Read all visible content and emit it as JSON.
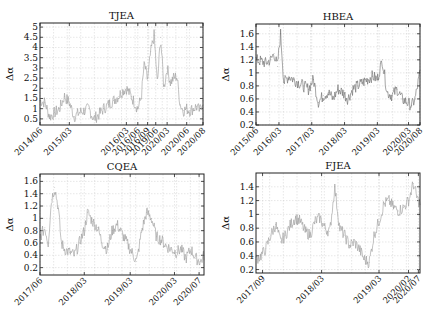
{
  "chart_data": [
    {
      "type": "line",
      "title": "TJEA",
      "xlabel": "",
      "ylabel": "Δα",
      "ylim": [
        0.2,
        5.2
      ],
      "yticks": [
        0.5,
        1,
        1.5,
        2,
        2.5,
        3,
        3.5,
        4,
        4.5,
        5
      ],
      "ytick_labels": [
        "0.5",
        "1",
        "1.5",
        "2",
        "2.5",
        "3",
        "3.5",
        "4",
        "4.5",
        "5"
      ],
      "xtick_labels": [
        "2014/06",
        "2015/03",
        "2016/03",
        "2016/06",
        "2016/09",
        "2019/06",
        "2020/03",
        "2020/06",
        "2020/08"
      ],
      "xtick_positions": [
        0,
        0.18,
        0.53,
        0.6,
        0.66,
        0.71,
        0.78,
        0.9,
        1.0
      ],
      "grid": true,
      "legend": "none",
      "series": [
        {
          "name": "TJEA",
          "color": "#9a9a9a",
          "x": [
            0,
            0.03,
            0.06,
            0.09,
            0.12,
            0.15,
            0.18,
            0.21,
            0.24,
            0.27,
            0.3,
            0.33,
            0.36,
            0.39,
            0.42,
            0.45,
            0.48,
            0.51,
            0.53,
            0.56,
            0.6,
            0.62,
            0.64,
            0.66,
            0.68,
            0.7,
            0.72,
            0.74,
            0.76,
            0.78,
            0.8,
            0.82,
            0.84,
            0.86,
            0.88,
            0.9,
            0.92,
            0.94,
            0.96,
            0.98,
            1.0
          ],
          "values": [
            1.4,
            1.3,
            0.6,
            0.8,
            1.0,
            1.6,
            1.3,
            0.6,
            0.8,
            0.9,
            1.0,
            0.5,
            0.7,
            1.0,
            1.2,
            1.4,
            1.6,
            1.9,
            2.0,
            1.6,
            1.0,
            1.5,
            3.2,
            2.4,
            3.8,
            4.6,
            2.2,
            4.5,
            2.0,
            3.0,
            2.3,
            2.5,
            2.6,
            1.2,
            0.9,
            1.0,
            0.9,
            1.0,
            1.1,
            0.9,
            1.4
          ]
        }
      ]
    },
    {
      "type": "line",
      "title": "HBEA",
      "xlabel": "",
      "ylabel": "Δα",
      "ylim": [
        0.2,
        1.75
      ],
      "yticks": [
        0.2,
        0.4,
        0.6,
        0.8,
        1,
        1.2,
        1.4,
        1.6
      ],
      "ytick_labels": [
        "0.2",
        "0.4",
        "0.6",
        "0.8",
        "1",
        "1.2",
        "1.4",
        "1.6"
      ],
      "xtick_labels": [
        "2015/06",
        "2016/03",
        "2017/03",
        "2018/03",
        "2019/03",
        "2020/03",
        "2020/08"
      ],
      "xtick_positions": [
        0,
        0.14,
        0.34,
        0.54,
        0.74,
        0.93,
        1.0
      ],
      "grid": true,
      "legend": "none",
      "series": [
        {
          "name": "HBEA",
          "color": "#6a6a6a",
          "x": [
            0,
            0.03,
            0.06,
            0.09,
            0.11,
            0.13,
            0.15,
            0.17,
            0.2,
            0.23,
            0.26,
            0.29,
            0.32,
            0.35,
            0.38,
            0.41,
            0.44,
            0.47,
            0.5,
            0.53,
            0.56,
            0.59,
            0.62,
            0.65,
            0.68,
            0.71,
            0.74,
            0.77,
            0.8,
            0.83,
            0.86,
            0.89,
            0.92,
            0.95,
            0.97,
            1.0
          ],
          "values": [
            1.2,
            1.18,
            1.15,
            1.2,
            1.3,
            1.1,
            1.6,
            0.85,
            0.95,
            0.9,
            0.85,
            0.8,
            0.75,
            0.9,
            0.55,
            0.65,
            0.7,
            0.6,
            0.75,
            0.7,
            0.6,
            0.75,
            0.8,
            0.85,
            0.9,
            0.95,
            0.9,
            1.2,
            0.7,
            0.65,
            0.75,
            0.6,
            0.55,
            0.5,
            0.6,
            1.0
          ]
        }
      ]
    },
    {
      "type": "line",
      "title": "CQEA",
      "xlabel": "",
      "ylabel": "Δα",
      "ylim": [
        0.08,
        1.72
      ],
      "yticks": [
        0.2,
        0.4,
        0.6,
        0.8,
        1,
        1.2,
        1.4,
        1.6
      ],
      "ytick_labels": [
        "0.2",
        "0.4",
        "0.6",
        "0.8",
        "1",
        "1.2",
        "1.4",
        "1.6"
      ],
      "xtick_labels": [
        "2017/06",
        "2018/03",
        "2019/03",
        "2020/03",
        "2020/07"
      ],
      "xtick_positions": [
        0,
        0.27,
        0.55,
        0.82,
        0.97
      ],
      "grid": true,
      "legend": "none",
      "series": [
        {
          "name": "CQEA",
          "color": "#9a9a9a",
          "x": [
            0,
            0.03,
            0.05,
            0.07,
            0.09,
            0.11,
            0.13,
            0.15,
            0.18,
            0.21,
            0.24,
            0.27,
            0.29,
            0.32,
            0.35,
            0.38,
            0.41,
            0.44,
            0.47,
            0.5,
            0.53,
            0.56,
            0.59,
            0.62,
            0.65,
            0.68,
            0.71,
            0.74,
            0.77,
            0.8,
            0.83,
            0.86,
            0.89,
            0.92,
            0.95,
            0.98,
            1.0
          ],
          "values": [
            0.7,
            0.85,
            0.6,
            1.3,
            1.5,
            1.2,
            0.6,
            0.5,
            0.45,
            0.4,
            0.6,
            0.8,
            1.1,
            0.95,
            0.85,
            0.6,
            0.5,
            0.8,
            0.9,
            0.75,
            0.6,
            0.45,
            0.3,
            0.8,
            1.1,
            1.0,
            0.7,
            0.65,
            0.55,
            0.5,
            0.45,
            0.5,
            0.35,
            0.5,
            0.35,
            0.3,
            0.4
          ]
        }
      ]
    },
    {
      "type": "line",
      "title": "FJEA",
      "xlabel": "",
      "ylabel": "Δα",
      "ylim": [
        0.15,
        1.6
      ],
      "yticks": [
        0.2,
        0.4,
        0.6,
        0.8,
        1,
        1.2,
        1.4
      ],
      "ytick_labels": [
        "0.2",
        "0.4",
        "0.6",
        "0.8",
        "1",
        "1.2",
        "1.4"
      ],
      "xtick_labels": [
        "2017/09",
        "2018/03",
        "2019/03",
        "2020/02",
        "2020/07"
      ],
      "xtick_positions": [
        0.04,
        0.4,
        0.75,
        0.93,
        0.99
      ],
      "grid": true,
      "legend": "none",
      "series": [
        {
          "name": "FJEA",
          "color": "#9a9a9a",
          "x": [
            0,
            0.03,
            0.06,
            0.09,
            0.12,
            0.15,
            0.18,
            0.21,
            0.24,
            0.27,
            0.3,
            0.33,
            0.36,
            0.39,
            0.42,
            0.45,
            0.48,
            0.51,
            0.54,
            0.57,
            0.6,
            0.63,
            0.66,
            0.69,
            0.72,
            0.75,
            0.78,
            0.81,
            0.84,
            0.87,
            0.9,
            0.93,
            0.96,
            0.98,
            1.0
          ],
          "values": [
            0.35,
            0.4,
            0.5,
            0.7,
            0.85,
            0.6,
            0.7,
            0.85,
            0.95,
            0.9,
            0.75,
            0.7,
            0.9,
            0.95,
            0.8,
            0.75,
            1.4,
            0.8,
            0.7,
            0.55,
            0.6,
            0.5,
            0.35,
            0.3,
            0.7,
            0.9,
            1.15,
            1.2,
            1.1,
            1.05,
            1.1,
            1.2,
            1.45,
            1.25,
            1.15
          ]
        }
      ]
    }
  ]
}
